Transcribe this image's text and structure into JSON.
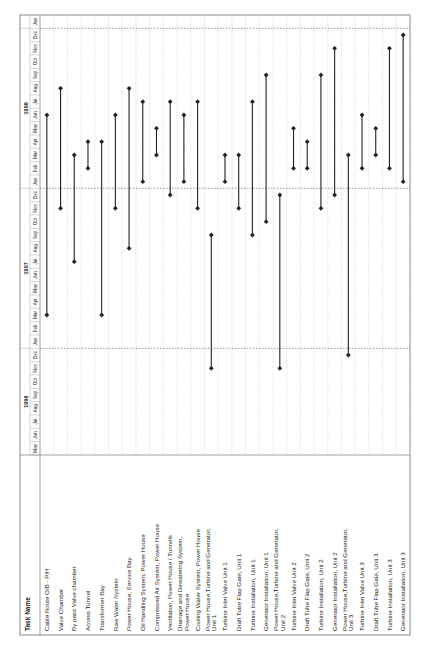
{
  "chart_data": {
    "type": "gantt",
    "title": "",
    "orientation": "rotated-90-ccw",
    "header": {
      "task_column_label": "Task Name"
    },
    "timescale": {
      "years": [
        {
          "label": "1996",
          "start": "1996-05",
          "end": "1996-12"
        },
        {
          "label": "1997",
          "start": "1997-01",
          "end": "1997-12"
        },
        {
          "label": "1998",
          "start": "1998-01",
          "end": "1998-12"
        },
        {
          "label": "",
          "start": "1999-01",
          "end": "1999-01"
        }
      ],
      "months": [
        "May",
        "Jun",
        "Jul",
        "Aug",
        "Sep",
        "Oct",
        "Nov",
        "Dec",
        "Jan",
        "Feb",
        "Mar",
        "Apr",
        "May",
        "Jun",
        "Jul",
        "Aug",
        "Sep",
        "Oct",
        "Nov",
        "Dec",
        "Jan",
        "Feb",
        "Mar",
        "Apr",
        "May",
        "Jun",
        "Jul",
        "Aug",
        "Sep",
        "Oct",
        "Nov",
        "Dec",
        "Jan"
      ],
      "range": [
        "1996-05",
        "1999-01"
      ],
      "year_boundaries": [
        "1997-01",
        "1998-01",
        "1999-01"
      ]
    },
    "tasks": [
      {
        "name": "Cable Route O/B - P/H",
        "start": "1997-03",
        "end": "1998-06"
      },
      {
        "name": "Valve Chamber",
        "start": "1997-11",
        "end": "1998-08"
      },
      {
        "name": "By pass Valve chamber",
        "start": "1997-07",
        "end": "1998-03"
      },
      {
        "name": "Access Tunnel",
        "start": "1998-02",
        "end": "1998-04"
      },
      {
        "name": "Transformer Bay",
        "start": "1997-03",
        "end": "1998-04"
      },
      {
        "name": "Raw Water System",
        "start": "1997-11",
        "end": "1998-06"
      },
      {
        "name": "Power House, Service Bay",
        "start": "1997-08",
        "end": "1998-08"
      },
      {
        "name": "Oil Handling System, Power House",
        "start": "1998-01",
        "end": "1998-07"
      },
      {
        "name": "Compressed Air System, Power House",
        "start": "1998-03",
        "end": "1998-05"
      },
      {
        "name": "Ventilation, Power House / Tunnels",
        "start": "1997-12",
        "end": "1998-07"
      },
      {
        "name": "Drainage and Dewatering System, Power House",
        "start": "1998-01",
        "end": "1998-06"
      },
      {
        "name": "Cooling Water System, Power House",
        "start": "1997-11",
        "end": "1998-07"
      },
      {
        "name": "Power House,Turbine and Generator, Unit 1",
        "start": "1996-11",
        "end": "1997-09"
      },
      {
        "name": "Turbine Inlet Valve Unit 1",
        "start": "1998-01",
        "end": "1998-03"
      },
      {
        "name": "Draft Tube Flap Gate, Unit 1",
        "start": "1997-11",
        "end": "1998-03"
      },
      {
        "name": "Turbine Installation, Unit 1",
        "start": "1997-09",
        "end": "1998-07"
      },
      {
        "name": "Generator Installation, Unit 1",
        "start": "1997-10",
        "end": "1998-09"
      },
      {
        "name": "Power House,Turbine and Generator, Unit 2",
        "start": "1996-11",
        "end": "1997-12"
      },
      {
        "name": "Turbine Inlet Valve Unit 2",
        "start": "1998-02",
        "end": "1998-05"
      },
      {
        "name": "Draft Tube Flap Gate, Unit 2",
        "start": "1998-02",
        "end": "1998-04"
      },
      {
        "name": "Turbine Installation, Unit 2",
        "start": "1997-11",
        "end": "1998-09"
      },
      {
        "name": "Generator Installation, Unit 2",
        "start": "1997-12",
        "end": "1998-11"
      },
      {
        "name": "Power House,Turbine and Generator, Unit 3",
        "start": "1996-12",
        "end": "1998-03"
      },
      {
        "name": "Turbine Inlet Valve Unit 3",
        "start": "1998-02",
        "end": "1998-06"
      },
      {
        "name": "Draft Tube Flap Gate, Unit 3",
        "start": "1998-03",
        "end": "1998-05"
      },
      {
        "name": "Turbine Installation, Unit 3",
        "start": "1998-02",
        "end": "1998-11"
      },
      {
        "name": "Generator Installation, Unit 3",
        "start": "1998-01",
        "end": "1998-12"
      }
    ],
    "colors": {
      "bar": "#222222",
      "grid": "#cfcfcf",
      "frame": "#888888",
      "boundary": "#555555"
    },
    "grid": true,
    "legend": "none"
  }
}
